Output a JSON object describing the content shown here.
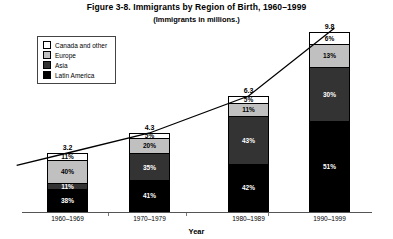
{
  "chart_data": {
    "type": "bar",
    "subtype": "stacked-bar-100-percent-with-trendline",
    "title": "Figure 3-8. Immigrants by Region of Birth, 1960–1999",
    "subtitle": "(Immigrants in millions.)",
    "xlabel": "Year",
    "ylabel": "",
    "categories": [
      "1960–1969",
      "1970–1979",
      "1980–1989",
      "1990–1999"
    ],
    "totals": [
      3.2,
      4.3,
      6.3,
      9.8
    ],
    "total_labels": [
      "3.2",
      "4.3",
      "6.3",
      "9.8"
    ],
    "total_unit": "millions",
    "ylim": [
      0,
      9.8
    ],
    "grid": false,
    "legend_position": "top-left",
    "stack_order_top_to_bottom": [
      "Canada and other",
      "Europe",
      "Asia",
      "Latin America"
    ],
    "series": [
      {
        "name": "Canada and other",
        "color": "#ffffff",
        "text_color": "#000000",
        "values": [
          11,
          5,
          5,
          6
        ],
        "labels": [
          "11%",
          "5%",
          "5%",
          "6%"
        ]
      },
      {
        "name": "Europe",
        "color": "#c0c0c0",
        "text_color": "#000000",
        "values": [
          40,
          20,
          11,
          13
        ],
        "labels": [
          "40%",
          "20%",
          "11%",
          "13%"
        ]
      },
      {
        "name": "Asia",
        "color": "#333333",
        "text_color": "#ffffff",
        "values": [
          11,
          35,
          43,
          30
        ],
        "labels": [
          "11%",
          "35%",
          "43%",
          "30%"
        ]
      },
      {
        "name": "Latin America",
        "color": "#000000",
        "text_color": "#ffffff",
        "values": [
          38,
          41,
          42,
          51
        ],
        "labels": [
          "38%",
          "41%",
          "42%",
          "51%"
        ]
      }
    ],
    "trendline": {
      "present": true,
      "description": "line connecting tops of the bars",
      "color": "#000000"
    }
  },
  "legend": {
    "items": [
      {
        "label": "Canada and other",
        "color": "#ffffff"
      },
      {
        "label": "Europe",
        "color": "#c0c0c0"
      },
      {
        "label": "Asia",
        "color": "#333333"
      },
      {
        "label": "Latin America",
        "color": "#000000"
      }
    ]
  }
}
